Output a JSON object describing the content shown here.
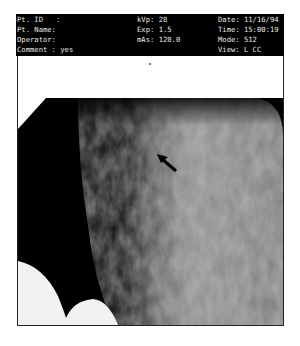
{
  "header": {
    "patient_id": "Pt. ID   :",
    "patient_name": "Pt. Name:",
    "operator": "Operator:",
    "comment": "Comment : yes",
    "kvp": "kVp: 28",
    "exposure": "Exp: 1.5",
    "mas": "mAs: 120.0",
    "date": "Date: 11/16/94",
    "time": "Time: 15:00:19",
    "mode": "Mode: 512",
    "view": "View: L CC"
  },
  "image": {
    "type": "mammogram",
    "view": "L CC",
    "annotation": "arrow-pointer"
  },
  "colors": {
    "header_bg": "#000000",
    "header_text": "#e8e8e8",
    "page_bg": "#ffffff"
  }
}
